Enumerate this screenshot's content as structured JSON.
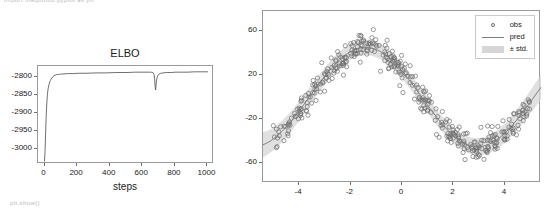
{
  "page": {
    "clipped_top_text": "import matplotlib.pyplot as plt",
    "clipped_bottom_text": "plt.show()"
  },
  "chart_data": [
    {
      "id": "elbo",
      "type": "line",
      "title": "ELBO",
      "xlabel": "steps",
      "ylabel": "",
      "xlim": [
        -40,
        1040
      ],
      "ylim": [
        -3040,
        -2770
      ],
      "grid": false,
      "legend_position": "none",
      "xticks": [
        0,
        200,
        400,
        600,
        800,
        1000
      ],
      "xtick_labels": [
        "0",
        "200",
        "400",
        "600",
        "800",
        "1000"
      ],
      "yticks": [
        -2800,
        -2850,
        -2900,
        -2950,
        -3000
      ],
      "ytick_labels": [
        "-2800",
        "-2850",
        "-2900",
        "-2950",
        "-3000"
      ],
      "series": [
        {
          "name": "elbo",
          "color": "#4a4a4a",
          "x": [
            0,
            3,
            6,
            9,
            12,
            15,
            18,
            21,
            24,
            28,
            32,
            36,
            40,
            45,
            50,
            58,
            66,
            74,
            82,
            92,
            104,
            120,
            140,
            170,
            210,
            260,
            320,
            380,
            440,
            500,
            560,
            610,
            650,
            665,
            672,
            676,
            679,
            681,
            683,
            686,
            690,
            696,
            704,
            714,
            728,
            748,
            775,
            805,
            840,
            880,
            920,
            960,
            1000
          ],
          "y": [
            -3032,
            -3008,
            -2966,
            -2924,
            -2889,
            -2866,
            -2848,
            -2836,
            -2828,
            -2820,
            -2814,
            -2810,
            -2806,
            -2803,
            -2800,
            -2797,
            -2795,
            -2794,
            -2793,
            -2793,
            -2792,
            -2792,
            -2791,
            -2791,
            -2790,
            -2790,
            -2789,
            -2789,
            -2788,
            -2788,
            -2787,
            -2787,
            -2787,
            -2788,
            -2793,
            -2808,
            -2826,
            -2836,
            -2830,
            -2815,
            -2803,
            -2796,
            -2792,
            -2790,
            -2789,
            -2788,
            -2788,
            -2787,
            -2787,
            -2787,
            -2786,
            -2786,
            -2786
          ]
        }
      ]
    },
    {
      "id": "regression",
      "type": "scatter",
      "title": "",
      "xlabel": "",
      "ylabel": "",
      "xlim": [
        -5.4,
        5.4
      ],
      "ylim": [
        -78,
        78
      ],
      "grid": false,
      "legend_position": "upper right",
      "xticks": [
        -4,
        -2,
        0,
        2,
        4
      ],
      "xtick_labels": [
        "-4",
        "-2",
        "0",
        "2",
        "4"
      ],
      "yticks": [
        60,
        20,
        -20,
        -60
      ],
      "ytick_labels": [
        "60",
        "20",
        "-20",
        "-60"
      ],
      "legend": [
        {
          "label": "obs",
          "marker": "circle",
          "color": "#6d6d6d"
        },
        {
          "label": "pred",
          "marker": "line",
          "color": "#7d7d7d"
        },
        {
          "label": "± std.",
          "marker": "band",
          "color": "#d6d6d6"
        }
      ],
      "model": {
        "description": "pred(x) = 45 * sin(0.72*(x + 3.6)) approx; noise std ~9, band std ~7",
        "amplitude": 45,
        "frequency": 0.72,
        "phase_shift": 3.6,
        "noise_std": 9,
        "band_std": 7,
        "n_points": 380,
        "peak_x": -2.0,
        "peak_y": 45,
        "trough_x": 2.4,
        "trough_y": -45
      },
      "marker_color": "#6d6d6d",
      "line_color": "#7d7d7d",
      "band_color": "#d6d6d6"
    }
  ]
}
